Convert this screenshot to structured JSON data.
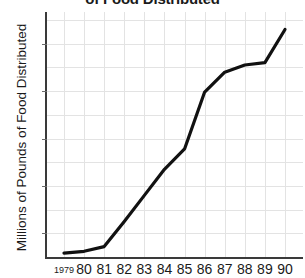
{
  "title": "of Food Distributed",
  "axis": {
    "ylabel": "Millions of Pounds of Food Distributed",
    "xlabel": "",
    "yticks": [
      "450",
      "350",
      "250",
      "150",
      "50"
    ],
    "xticks": [
      "1979",
      "80",
      "81",
      "82",
      "83",
      "84",
      "85",
      "86",
      "87",
      "88",
      "89",
      "90"
    ]
  },
  "style": {
    "line_color": "#111111",
    "grid_color": "#e3e3e3",
    "axis_color": "#3a3a3a",
    "text_color": "#1a1a1a",
    "background": "#ffffff"
  },
  "chart_data": {
    "type": "line",
    "title": "of Food Distributed",
    "xlabel": "",
    "ylabel": "Millions of Pounds of Food Distributed",
    "categories": [
      "1979",
      "80",
      "81",
      "82",
      "83",
      "84",
      "85",
      "86",
      "87",
      "88",
      "89",
      "90"
    ],
    "x": [
      1979,
      1980,
      1981,
      1982,
      1983,
      1984,
      1985,
      1986,
      1987,
      1988,
      1989,
      1990
    ],
    "values": [
      8,
      12,
      22,
      75,
      130,
      185,
      228,
      348,
      390,
      405,
      410,
      480
    ],
    "series": [
      {
        "name": "Food Distributed",
        "values": [
          8,
          12,
          22,
          75,
          130,
          185,
          228,
          348,
          390,
          405,
          410,
          480
        ]
      }
    ],
    "ylim": [
      0,
      500
    ],
    "ytick_values": [
      50,
      150,
      250,
      350,
      450
    ],
    "grid": true,
    "legend": false,
    "legend_position": "none"
  }
}
